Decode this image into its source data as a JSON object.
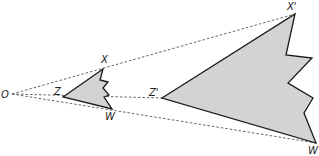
{
  "diagram": {
    "type": "dilation",
    "center": {
      "label": "O",
      "x": 12,
      "y": 94
    },
    "colors": {
      "fill": "#d3d3d3",
      "stroke": "#1a1a1a",
      "ray": "#555555"
    },
    "original_shape": {
      "labels": {
        "X": "X",
        "Z": "Z",
        "W": "W"
      },
      "points": "63,97 103,69 100,80 108,82 103,88 109,95 104,97 112,109"
    },
    "image_shape": {
      "labels": {
        "X": "X'",
        "Z": "Z'",
        "W": "W'"
      },
      "points": "162,98 295,14 286,55 312,58 288,83 313,98 304,113 316,143"
    },
    "rays": [
      {
        "to": "X'",
        "x1": 12,
        "y1": 94,
        "x2": 295,
        "y2": 14
      },
      {
        "to": "Z'",
        "x1": 12,
        "y1": 94,
        "x2": 162,
        "y2": 98
      },
      {
        "to": "W'",
        "x1": 12,
        "y1": 94,
        "x2": 316,
        "y2": 143
      }
    ]
  }
}
